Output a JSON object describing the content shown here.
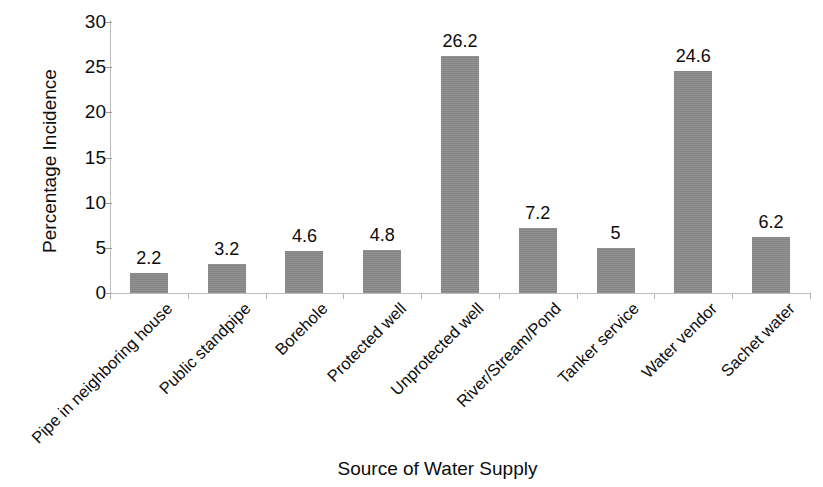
{
  "chart_data": {
    "type": "bar",
    "title": "",
    "xlabel": "Source of Water Supply",
    "ylabel": "Percentage Incidence",
    "categories": [
      "Pipe in neighboring house",
      "Public standpipe",
      "Borehole",
      "Protected well",
      "Unprotected well",
      "River/Stream/Pond",
      "Tanker service",
      "Water vendor",
      "Sachet water"
    ],
    "values": [
      2.2,
      3.2,
      4.6,
      4.8,
      26.2,
      7.2,
      5,
      24.6,
      6.2
    ],
    "value_labels": [
      "2.2",
      "3.2",
      "4.6",
      "4.8",
      "26.2",
      "7.2",
      "5",
      "24.6",
      "6.2"
    ],
    "ylim": [
      0,
      30
    ],
    "y_ticks": [
      0,
      5,
      10,
      15,
      20,
      25,
      30
    ],
    "y_tick_labels": [
      "0",
      "5",
      "10",
      "15",
      "20",
      "25",
      "30"
    ],
    "grid": false,
    "legend": "none",
    "bar_color": "#8a8a8a",
    "axis_color": "#bdbdbd",
    "text_color": "#0d0d0d"
  }
}
